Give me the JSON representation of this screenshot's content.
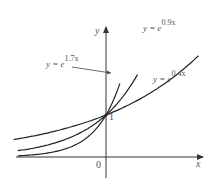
{
  "chart_data": {
    "type": "line",
    "title": "",
    "xlabel": "x",
    "ylabel": "y",
    "origin_label": "0",
    "intercept_label": "1",
    "grid": false,
    "legend": "inline annotations",
    "series": [
      {
        "name": "y = e^{1.7x}",
        "base": "y = e",
        "exponent": "1.7x",
        "k": 1.7
      },
      {
        "name": "y = e^{0.9x}",
        "base": "y = e",
        "exponent": "0.9x",
        "k": 0.9
      },
      {
        "name": "y = e^{0.4x}",
        "base": "y = e",
        "exponent": "0.4x",
        "k": 0.4
      }
    ],
    "annotations": [
      {
        "text": "y = e^{1.7x}",
        "arrow_to": "curve k=1.7"
      },
      {
        "text": "y = e^{0.9x}",
        "position": "top right of curve"
      },
      {
        "text": "y = e^{0.4x}",
        "position": "right of curve"
      },
      {
        "text": "1",
        "at": [
          0,
          1
        ]
      }
    ]
  },
  "labels": {
    "y_axis": "y",
    "x_axis": "x",
    "origin": "0",
    "intercept": "1",
    "curve_17_base": "y = e",
    "curve_17_exp": "1.7x",
    "curve_09_base": "y = e",
    "curve_09_exp": "0.9x",
    "curve_04_base": "y = e",
    "curve_04_exp": "0.4x"
  },
  "colors": {
    "curve": "#222222",
    "axis": "#333333",
    "text": "#555555"
  }
}
